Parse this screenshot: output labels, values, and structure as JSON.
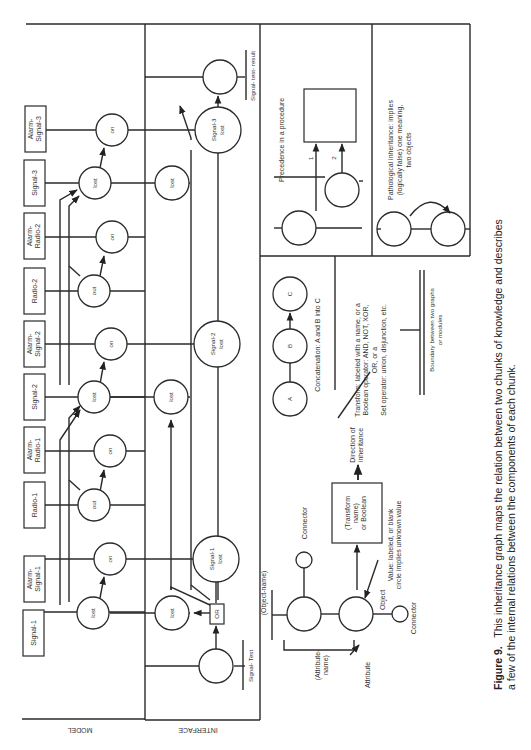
{
  "figure": {
    "caption_label": "Figure 9.",
    "caption_line1": "This inheritance graph maps the relation between two chunks of knowledge and describes",
    "caption_line2": "a few of the internal relations between the components of each chunk."
  },
  "main_diagram": {
    "region_model_label": "MODEL",
    "region_interface_label": "INTERFACE",
    "model_boxes": [
      {
        "id": "b1",
        "label1": "Signal-1",
        "label2": ""
      },
      {
        "id": "b2",
        "label1": "Alarm-",
        "label2": "Signal-1"
      },
      {
        "id": "b3",
        "label1": "Radio-1",
        "label2": ""
      },
      {
        "id": "b4",
        "label1": "Alarm-",
        "label2": "Radio-1"
      },
      {
        "id": "b5",
        "label1": "Signal-2",
        "label2": ""
      },
      {
        "id": "b6",
        "label1": "Alarm-",
        "label2": "Signal-2"
      },
      {
        "id": "b7",
        "label1": "Radio-2",
        "label2": ""
      },
      {
        "id": "b8",
        "label1": "Alarm-",
        "label2": "Radio-2"
      },
      {
        "id": "b9",
        "label1": "Signal-3",
        "label2": ""
      },
      {
        "id": "b10",
        "label1": "Alarm-",
        "label2": "Signal-3"
      }
    ],
    "model_nodes": [
      {
        "id": "n1",
        "label": "lost"
      },
      {
        "id": "n2",
        "label": "on"
      },
      {
        "id": "n3",
        "label": "out"
      },
      {
        "id": "n4",
        "label": "on"
      },
      {
        "id": "n5",
        "label": "lost"
      },
      {
        "id": "n6",
        "label": "on"
      },
      {
        "id": "n7",
        "label": "out"
      },
      {
        "id": "n8",
        "label": "on"
      },
      {
        "id": "n9",
        "label": "lost"
      },
      {
        "id": "n10",
        "label": "on"
      }
    ],
    "interface_nodes": [
      {
        "id": "i1",
        "label": "lost"
      },
      {
        "id": "i2",
        "label": "lost"
      },
      {
        "id": "i3",
        "label": "lost"
      },
      {
        "id": "s1",
        "label1": "Signal-1",
        "label2": "lost"
      },
      {
        "id": "s2",
        "label1": "Signal-2",
        "label2": "lost"
      },
      {
        "id": "s3",
        "label1": "Signal-3",
        "label2": "lost"
      },
      {
        "id": "test",
        "label": ""
      },
      {
        "id": "result",
        "label": ""
      }
    ],
    "or_box_label": "OR",
    "signal_test_label": "Signal- Test",
    "signal_test_result_label": "Signal- test- result"
  },
  "legend": {
    "object_name_label": "(Object-name)",
    "connector_top_label": "Connector",
    "connector_bottom_label": "Connector",
    "object_label": "Object",
    "attribute_name_label1": "(Attribute-",
    "attribute_name_label2": "name)",
    "attribute_label": "Attribute",
    "transform_box_line1": "(Transform",
    "transform_box_line2": "name)",
    "transform_box_line3": "or Boolean",
    "value_note_line1": "Value: labeled, or blank",
    "value_note_line2": "circle implies unknown value",
    "direction_line1": "Direction of",
    "direction_line2": "inheritance",
    "transform_note_line1": "Transform: labeled with a name, or a",
    "transform_note_line2": "Boolean operator: AND, NOT, XOR,",
    "transform_note_line3": "OR, or a",
    "transform_note_line4": "Set operator: union, disjunction, etc.",
    "concat_nodes": [
      "A",
      "B",
      "C"
    ],
    "concat_label": "Concatenation: A and B into C",
    "boundary_line1": "Boundary between two graphs",
    "boundary_line2": "or modules",
    "precedence_label": "Precedence in a procedure",
    "precedence_arrow1": "1",
    "precedence_arrow2": "2",
    "pathological_line1": "Pathological inheritance: implies",
    "pathological_line2": "(logically false) one meaning,",
    "pathological_line3": "two objects"
  }
}
